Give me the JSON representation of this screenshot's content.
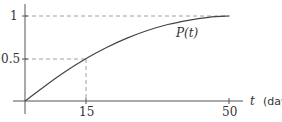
{
  "chart_data": {
    "type": "line",
    "title": "",
    "xlabel": "t (days)",
    "ylabel": "",
    "xlim": [
      0,
      50
    ],
    "ylim": [
      0,
      1
    ],
    "grid": false,
    "legend": null,
    "x_ticks": [
      15,
      50
    ],
    "x_tick_labels": [
      "15",
      "50"
    ],
    "y_ticks": [
      0.5,
      1
    ],
    "y_tick_labels": [
      "0.5",
      "1"
    ],
    "series": [
      {
        "name": "P(t)",
        "x": [
          0,
          5,
          10,
          15,
          20,
          25,
          30,
          35,
          40,
          45,
          50
        ],
        "values": [
          0,
          0.18,
          0.35,
          0.5,
          0.63,
          0.74,
          0.83,
          0.9,
          0.95,
          0.985,
          1
        ]
      }
    ],
    "annotations": [
      {
        "type": "dashed-guide",
        "from": [
          0,
          0.5
        ],
        "to": [
          15,
          0.5
        ],
        "then_to": [
          15,
          0
        ],
        "text": "P(15) = 0.5"
      },
      {
        "type": "dashed-guide",
        "from": [
          0,
          1
        ],
        "to": [
          50,
          1
        ],
        "text": "asymptote P = 1"
      },
      {
        "type": "curve-label",
        "text": "P(t)",
        "at": [
          38,
          0.82
        ]
      }
    ]
  },
  "labels": {
    "y_tick_1": "1",
    "y_tick_half": "0.5",
    "x_tick_15": "15",
    "x_tick_50": "50",
    "curve": "P(t)",
    "x_axis_var": "t",
    "x_axis_unit": "(days)"
  }
}
